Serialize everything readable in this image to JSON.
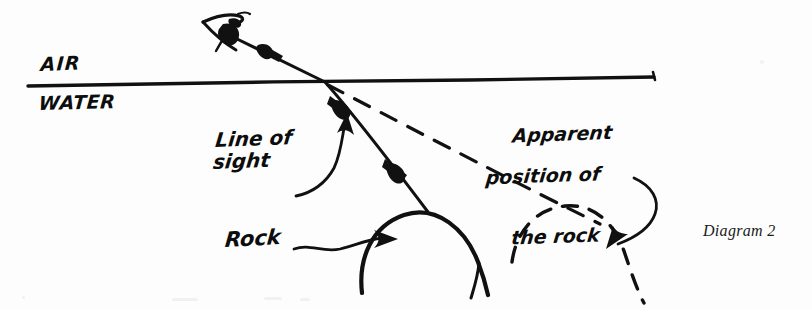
{
  "diagram": {
    "caption": "Diagram 2",
    "labels": {
      "air": "AIR",
      "water": "WATER",
      "line_of_sight": "Line of\nsight",
      "line_of_sight_l1": "Line of",
      "line_of_sight_l2": "sight",
      "rock": "Rock",
      "apparent_l1": "Apparent",
      "apparent_l2": "position of",
      "apparent_l3": "the rock"
    },
    "ink_color": "#111111",
    "paper_color": "#fdfdfd",
    "elements": [
      {
        "name": "eye",
        "kind": "sketch-eye"
      },
      {
        "name": "incident-ray",
        "kind": "solid-line-with-arrowheads"
      },
      {
        "name": "water-surface-line",
        "kind": "solid-line"
      },
      {
        "name": "refracted-ray",
        "kind": "solid-line-with-arrowheads"
      },
      {
        "name": "apparent-sight-line",
        "kind": "dashed-line"
      },
      {
        "name": "rock-arc",
        "kind": "solid-arc"
      },
      {
        "name": "apparent-rock-arc",
        "kind": "dashed-arc"
      },
      {
        "name": "rock-leader-arrow",
        "kind": "wavy-arrow"
      },
      {
        "name": "line-of-sight-leader-arrow",
        "kind": "curved-arrow"
      },
      {
        "name": "apparent-rock-leader-arrow",
        "kind": "curved-arrow"
      }
    ]
  }
}
